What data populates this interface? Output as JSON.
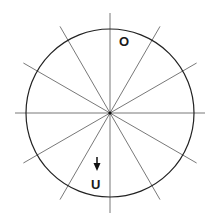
{
  "diagram": {
    "center": {
      "x": 110,
      "y": 113
    },
    "radius": 84,
    "line_length": 100,
    "line_angles_deg": [
      0,
      30,
      60,
      90,
      120,
      150
    ],
    "labels": {
      "top": "O",
      "bottom": "U"
    },
    "arrow": {
      "direction": "down"
    },
    "colors": {
      "circle": "#222222",
      "lines": "#555555",
      "text": "#1a1a1a",
      "background": "#ffffff"
    }
  }
}
